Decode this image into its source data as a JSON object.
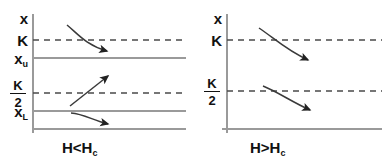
{
  "figure": {
    "type": "diagram",
    "background_color": "#ffffff",
    "line_color": "#808080",
    "arrow_color": "#333333",
    "text_color": "#111111"
  },
  "panels": [
    {
      "id": "left",
      "caption": {
        "text": "H<H",
        "subscript": "c",
        "full": "H<H_c"
      },
      "axis": {
        "vertical_label": "x",
        "labels": [
          {
            "text": "x",
            "kind": "plain",
            "value": "x",
            "y": 18
          },
          {
            "text": "K",
            "kind": "plain",
            "value": "K",
            "y": 40
          },
          {
            "text": "x",
            "kind": "subscript",
            "value": "x_u",
            "subscript": "u",
            "y": 58
          },
          {
            "text": "K/2",
            "kind": "fraction",
            "numerator": "K",
            "denominator": "2",
            "value": "K/2",
            "y": 93
          },
          {
            "text": "x",
            "kind": "subscript",
            "value": "x_L",
            "subscript": "L",
            "y": 111
          }
        ]
      },
      "levels": [
        {
          "name": "K",
          "style": "dashed",
          "y": 40
        },
        {
          "name": "x_u",
          "style": "solid",
          "y": 58
        },
        {
          "name": "K/2",
          "style": "dashed",
          "y": 93
        },
        {
          "name": "x_L",
          "style": "solid",
          "y": 111
        },
        {
          "name": "base",
          "style": "solid",
          "y": 129
        }
      ],
      "arrows": [
        {
          "name": "arrow-down-upper",
          "direction": "down",
          "from": [
            68,
            26
          ],
          "to": [
            112,
            52
          ],
          "curved": true
        },
        {
          "name": "arrow-up-middle",
          "direction": "up",
          "from": [
            71,
            105
          ],
          "to": [
            112,
            74
          ],
          "curved": false
        },
        {
          "name": "arrow-down-lower",
          "direction": "down",
          "from": [
            72,
            113
          ],
          "to": [
            113,
            125
          ],
          "curved": true
        }
      ]
    },
    {
      "id": "right",
      "caption": {
        "text": "H>H",
        "subscript": "c",
        "full": "H>H_c"
      },
      "axis": {
        "vertical_label": "x",
        "labels": [
          {
            "text": "x",
            "kind": "plain",
            "value": "x",
            "y": 18
          },
          {
            "text": "K",
            "kind": "plain",
            "value": "K",
            "y": 40
          },
          {
            "text": "K/2",
            "kind": "fraction",
            "numerator": "K",
            "denominator": "2",
            "value": "K/2",
            "y": 91
          }
        ]
      },
      "levels": [
        {
          "name": "K",
          "style": "dashed",
          "y": 40
        },
        {
          "name": "K/2",
          "style": "dashed",
          "y": 91
        },
        {
          "name": "base",
          "style": "solid",
          "y": 129
        }
      ],
      "arrows": [
        {
          "name": "arrow-down-upper",
          "direction": "down",
          "from": [
            66,
            28
          ],
          "to": [
            118,
            62
          ],
          "curved": true
        },
        {
          "name": "arrow-down-lower",
          "direction": "down",
          "from": [
            70,
            86
          ],
          "to": [
            120,
            113
          ],
          "curved": true
        }
      ]
    }
  ]
}
